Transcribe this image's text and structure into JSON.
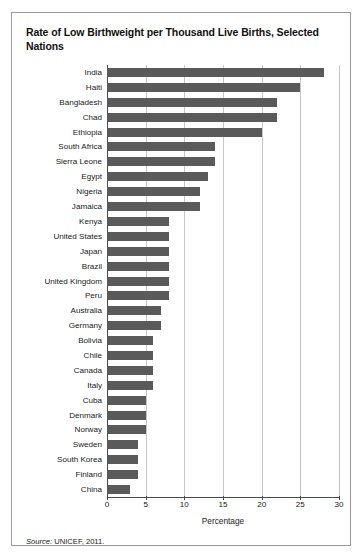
{
  "figure": {
    "title": "Rate of Low Birthweight per Thousand Live Births, Selected Nations",
    "source_label": "Source:",
    "source_text": " UNICEF, 2011.",
    "bar_color": "#5a5a5a",
    "grid_color": "#c8c8c8",
    "axis_color": "#4a4a4a"
  },
  "chart_data": {
    "type": "bar",
    "orientation": "horizontal",
    "title": "Rate of Low Birthweight per Thousand Live Births, Selected Nations",
    "xlabel": "Percentage",
    "ylabel": "",
    "xlim": [
      0,
      30
    ],
    "xticks": [
      0,
      5,
      10,
      15,
      20,
      25,
      30
    ],
    "grid": true,
    "legend": "none",
    "categories": [
      "India",
      "Haiti",
      "Bangladesh",
      "Chad",
      "Ethiopia",
      "South Africa",
      "Sierra Leone",
      "Egypt",
      "Nigeria",
      "Jamaica",
      "Kenya",
      "United States",
      "Japan",
      "Brazil",
      "United Kingdom",
      "Peru",
      "Australia",
      "Germany",
      "Bolivia",
      "Chile",
      "Canada",
      "Italy",
      "Cuba",
      "Denmark",
      "Norway",
      "Sweden",
      "South Korea",
      "Finland",
      "China"
    ],
    "values": [
      28,
      25,
      22,
      22,
      20,
      14,
      14,
      13,
      12,
      12,
      8,
      8,
      8,
      8,
      8,
      8,
      7,
      7,
      6,
      6,
      6,
      6,
      5,
      5,
      5,
      4,
      4,
      4,
      3
    ]
  }
}
